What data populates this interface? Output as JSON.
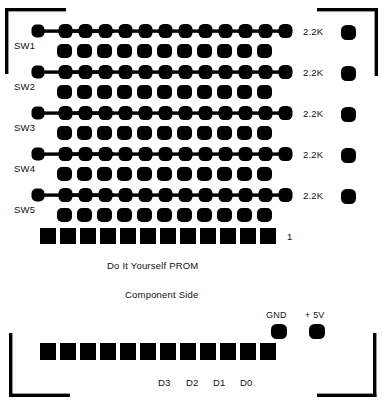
{
  "diagram": {
    "title": "Do It Yourself PROM",
    "subtitle": "Component Side",
    "ink_color": "#000000",
    "background_color": "#ffffff"
  },
  "switch_labels": [
    {
      "id": "sw1",
      "text": "SW1"
    },
    {
      "id": "sw2",
      "text": "SW2"
    },
    {
      "id": "sw3",
      "text": "SW3"
    },
    {
      "id": "sw4",
      "text": "SW4"
    },
    {
      "id": "sw5",
      "text": "SW5"
    }
  ],
  "resistor_labels": [
    {
      "id": "r1",
      "text": "2.2K"
    },
    {
      "id": "r2",
      "text": "2.2K"
    },
    {
      "id": "r3",
      "text": "2.2K"
    },
    {
      "id": "r4",
      "text": "2.2K"
    },
    {
      "id": "r5",
      "text": "2.2K"
    }
  ],
  "pin_marker": {
    "text": "1"
  },
  "power_labels": [
    {
      "id": "gnd",
      "text": "GND"
    },
    {
      "id": "v5",
      "text": "+ 5V"
    }
  ],
  "data_labels": [
    {
      "id": "d3",
      "text": "D3"
    },
    {
      "id": "d2",
      "text": "D2"
    },
    {
      "id": "d1",
      "text": "D1"
    },
    {
      "id": "d0",
      "text": "D0"
    }
  ],
  "layout": {
    "width": 382,
    "height": 410,
    "trace_rows": 5,
    "pads_per_trace_row": 12,
    "pads_per_offset_row": 11,
    "top_square_pads": 12,
    "bottom_square_pads": 12
  }
}
